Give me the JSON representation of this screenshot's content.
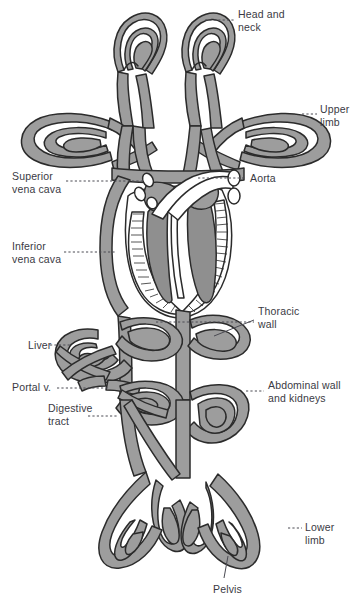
{
  "figure": {
    "type": "anatomical-schematic",
    "palette": {
      "vessel_fill": "#9d9d9d",
      "vessel_outline": "#2b2b2b",
      "chamber_fill": "#8f8f8f",
      "myocardium_fill": "#ffffff",
      "label_text": "#3a3a44",
      "leader_line": "#4a4a52",
      "background": "#ffffff"
    }
  },
  "labels": [
    {
      "id": "head-and-neck",
      "text": "Head and\nneck",
      "x": 238,
      "y": 8,
      "side": "right"
    },
    {
      "id": "upper-limb",
      "text": "Upper\nlimb",
      "x": 320,
      "y": 103,
      "side": "right"
    },
    {
      "id": "aorta",
      "text": "Aorta",
      "x": 250,
      "y": 172,
      "side": "right"
    },
    {
      "id": "superior-vena-cava",
      "text": "Superior\nvena cava",
      "x": 12,
      "y": 170,
      "side": "left"
    },
    {
      "id": "inferior-vena-cava",
      "text": "Inferior\nvena cava",
      "x": 12,
      "y": 240,
      "side": "left"
    },
    {
      "id": "thoracic-wall",
      "text": "Thoracic\nwall",
      "x": 258,
      "y": 305,
      "side": "right"
    },
    {
      "id": "liver",
      "text": "Liver",
      "x": 28,
      "y": 341,
      "side": "left"
    },
    {
      "id": "portal-vein",
      "text": "Portal v.",
      "x": 12,
      "y": 381,
      "side": "left"
    },
    {
      "id": "digestive-tract",
      "text": "Digestive\ntract",
      "x": 48,
      "y": 402,
      "side": "left"
    },
    {
      "id": "abdominal-wall-kidneys",
      "text": "Abdominal wall\nand kidneys",
      "x": 268,
      "y": 379,
      "side": "right"
    },
    {
      "id": "lower-limb",
      "text": "Lower\nlimb",
      "x": 305,
      "y": 521,
      "side": "right"
    },
    {
      "id": "pelvis",
      "text": "Pelvis",
      "x": 213,
      "y": 583,
      "side": "bottom"
    }
  ],
  "leaders": [
    {
      "id": "leader-head-and-neck",
      "points": "205,20 234,20"
    },
    {
      "id": "leader-upper-limb",
      "points": "302,114 317,114"
    },
    {
      "id": "leader-aorta",
      "points": "198,178 246,178"
    },
    {
      "id": "leader-superior-vena-cava",
      "points": "66,181 143,181"
    },
    {
      "id": "leader-inferior-vena-cava",
      "points": "64,252 116,252"
    },
    {
      "id": "leader-thoracic-wall",
      "points": "156,322 254,322"
    },
    {
      "id": "leader-thoracic-wall-2",
      "points": "214,334 254,318"
    },
    {
      "id": "leader-liver",
      "points": "52,345 72,345"
    },
    {
      "id": "leader-portal-vein",
      "points": "57,388 108,388"
    },
    {
      "id": "leader-digestive-tract",
      "points": "88,416 118,416"
    },
    {
      "id": "leader-abdominal",
      "points": "246,391 264,391"
    },
    {
      "id": "leader-lower-limb",
      "points": "288,528 302,528"
    },
    {
      "id": "leader-pelvis",
      "points": "228,555 224,578"
    }
  ],
  "structures": [
    {
      "id": "head-neck-capillary-bed-left",
      "name": "head and neck capillary loops, left"
    },
    {
      "id": "head-neck-capillary-bed-right",
      "name": "head and neck capillary loops, right"
    },
    {
      "id": "upper-limb-bed-left",
      "name": "upper limb capillary bed, left"
    },
    {
      "id": "upper-limb-bed-right",
      "name": "upper limb capillary bed, right"
    },
    {
      "id": "heart",
      "name": "heart with four chambers and myocardium"
    },
    {
      "id": "aorta-arch",
      "name": "aortic arch and great vessels"
    },
    {
      "id": "superior-vena-cava-trunk",
      "name": "superior vena cava"
    },
    {
      "id": "inferior-vena-cava-trunk",
      "name": "inferior vena cava"
    },
    {
      "id": "thoracic-wall-bed",
      "name": "thoracic wall capillary bed"
    },
    {
      "id": "liver-bed",
      "name": "hepatic sinusoid bed"
    },
    {
      "id": "portal-vein-trunk",
      "name": "portal vein"
    },
    {
      "id": "digestive-tract-bed",
      "name": "digestive tract capillary bed"
    },
    {
      "id": "abdominal-kidney-bed",
      "name": "abdominal wall and kidney bed"
    },
    {
      "id": "pelvis-bed",
      "name": "pelvic capillary bed"
    },
    {
      "id": "lower-limb-bed-left",
      "name": "lower limb capillary bed, left"
    },
    {
      "id": "lower-limb-bed-right",
      "name": "lower limb capillary bed, right"
    }
  ]
}
